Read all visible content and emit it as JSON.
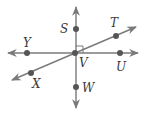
{
  "diagram": {
    "type": "geometry-lines",
    "colors": {
      "line": "#7a7a7a",
      "point": "#555555",
      "label": "#3a3a3a",
      "background": "#ffffff"
    },
    "lines": [
      {
        "name": "line-SW",
        "through": [
          "S",
          "V",
          "W"
        ],
        "arrows": "both"
      },
      {
        "name": "line-YU",
        "through": [
          "Y",
          "V",
          "U"
        ],
        "arrows": "both"
      },
      {
        "name": "line-XT",
        "through": [
          "X",
          "V",
          "T"
        ],
        "arrows": "both"
      }
    ],
    "right_angle_marker": {
      "at": "V",
      "between": [
        "S",
        "U"
      ]
    },
    "points": {
      "S": {
        "label": "S"
      },
      "T": {
        "label": "T"
      },
      "Y": {
        "label": "Y"
      },
      "V": {
        "label": "V"
      },
      "U": {
        "label": "U"
      },
      "X": {
        "label": "X"
      },
      "W": {
        "label": "W"
      }
    }
  }
}
